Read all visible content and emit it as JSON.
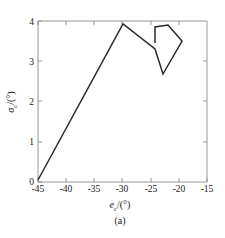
{
  "figure": {
    "caption": "(a)",
    "line_color": "#2b2b2b",
    "axis_color": "#8a8a8a",
    "background_color": "#ffffff"
  },
  "chart_data": {
    "type": "line",
    "title": "",
    "subtitle": "",
    "caption": "(a)",
    "xlabel": "e_c/(°)",
    "xlabel_symbol": "e",
    "xlabel_subscript": "c",
    "xlabel_unit": "/(°)",
    "ylabel": "σ_c/(°)",
    "ylabel_symbol": "σ",
    "ylabel_subscript": "c",
    "ylabel_unit": "/(°)",
    "xlim": [
      -45,
      -15
    ],
    "ylim": [
      0,
      4
    ],
    "xticks": [
      -45,
      -40,
      -35,
      -30,
      -25,
      -20,
      -15
    ],
    "yticks": [
      0,
      1,
      2,
      3,
      4
    ],
    "xticklabels": [
      "-45",
      "-40",
      "-35",
      "-30",
      "-25",
      "-20",
      "-15"
    ],
    "yticklabels": [
      "0",
      "1",
      "2",
      "3",
      "4"
    ],
    "grid": false,
    "legend": null,
    "series": [
      {
        "name": "hysteresis-path",
        "color": "#2b2b2b",
        "x": [
          -45.0,
          -29.9,
          -24.2,
          -22.8,
          -19.4,
          -20.7,
          -20.7,
          -22.1,
          -22.1
        ],
        "y": [
          0.05,
          3.92,
          3.3,
          2.68,
          3.5,
          3.72,
          3.72,
          3.82,
          3.37
        ]
      }
    ],
    "path_pixels": [
      [
        38,
        180
      ],
      [
        123,
        24
      ],
      [
        155,
        49
      ],
      [
        163,
        74
      ],
      [
        182,
        41
      ],
      [
        175,
        33
      ],
      [
        168,
        25
      ],
      [
        155,
        27
      ],
      [
        155,
        43
      ]
    ]
  }
}
